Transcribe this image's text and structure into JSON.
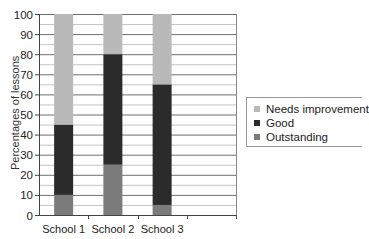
{
  "chart_data": {
    "type": "bar",
    "stacked": true,
    "title": "",
    "xlabel": "",
    "ylabel": "Percentages of lessons",
    "ylim": [
      0,
      100
    ],
    "yticks": [
      0,
      10,
      20,
      30,
      40,
      50,
      60,
      70,
      80,
      90,
      100
    ],
    "grid": {
      "major_every": 10,
      "minor_every": 5
    },
    "categories": [
      "School 1",
      "School 2",
      "School 3"
    ],
    "empty_trailing_slots": 1,
    "series": [
      {
        "name": "Outstanding",
        "color": "#7b7b7b",
        "values": [
          10,
          25,
          5
        ]
      },
      {
        "name": "Good",
        "color": "#2b2b2b",
        "values": [
          35,
          55,
          60
        ]
      },
      {
        "name": "Needs improvement",
        "color": "#b9b9b9",
        "values": [
          55,
          20,
          35
        ]
      }
    ],
    "legend": {
      "position": "right",
      "entries": [
        "Needs improvement",
        "Good",
        "Outstanding"
      ]
    }
  }
}
